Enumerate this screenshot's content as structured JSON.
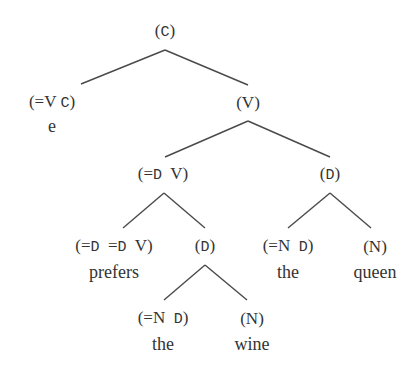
{
  "diagram": {
    "type": "syntax-tree",
    "colors": {
      "text": "#333333",
      "edge": "#4a4a4a",
      "background": "#ffffff"
    },
    "nodes": [
      {
        "id": "root",
        "label": "(C)",
        "segments": [
          {
            "text": "(",
            "font": "serif"
          },
          {
            "text": "C",
            "font": "mono"
          },
          {
            "text": ")",
            "font": "serif"
          }
        ],
        "x": 165,
        "y": 32
      },
      {
        "id": "comp-head",
        "label": "(=V C)",
        "segments": [
          {
            "text": "(=V ",
            "font": "serif"
          },
          {
            "text": "C",
            "font": "mono"
          },
          {
            "text": ")",
            "font": "serif"
          }
        ],
        "word": "e",
        "x": 52,
        "y": 103,
        "word_y": 126
      },
      {
        "id": "vp",
        "label": "(V)",
        "segments": [
          {
            "text": "(V)",
            "font": "serif"
          }
        ],
        "x": 248,
        "y": 103
      },
      {
        "id": "vbar",
        "label": "(=D V)",
        "segments": [
          {
            "text": "(=",
            "font": "serif"
          },
          {
            "text": "D",
            "font": "mono"
          },
          {
            "text": "  V)",
            "font": "serif"
          }
        ],
        "x": 163,
        "y": 175
      },
      {
        "id": "dp-subject",
        "label": "(D)",
        "segments": [
          {
            "text": "(",
            "font": "serif"
          },
          {
            "text": "D",
            "font": "mono"
          },
          {
            "text": ")",
            "font": "serif"
          }
        ],
        "x": 330,
        "y": 175
      },
      {
        "id": "verb",
        "label": "(=D =D V)",
        "segments": [
          {
            "text": "(=",
            "font": "serif"
          },
          {
            "text": "D",
            "font": "mono"
          },
          {
            "text": "  =",
            "font": "serif"
          },
          {
            "text": "D",
            "font": "mono"
          },
          {
            "text": "  V)",
            "font": "serif"
          }
        ],
        "word": "prefers",
        "x": 114,
        "y": 247,
        "word_y": 272
      },
      {
        "id": "dp-object",
        "label": "(D)",
        "segments": [
          {
            "text": "(",
            "font": "serif"
          },
          {
            "text": "D",
            "font": "mono"
          },
          {
            "text": ")",
            "font": "serif"
          }
        ],
        "x": 205,
        "y": 247
      },
      {
        "id": "det-subject",
        "label": "(=N D)",
        "segments": [
          {
            "text": "(=N  ",
            "font": "serif"
          },
          {
            "text": "D",
            "font": "mono"
          },
          {
            "text": ")",
            "font": "serif"
          }
        ],
        "word": "the",
        "x": 288,
        "y": 247,
        "word_y": 272
      },
      {
        "id": "noun-subject",
        "label": "(N)",
        "segments": [
          {
            "text": "(N)",
            "font": "serif"
          }
        ],
        "word": "queen",
        "x": 375,
        "y": 247,
        "word_y": 272
      },
      {
        "id": "det-object",
        "label": "(=N D)",
        "segments": [
          {
            "text": "(=N  ",
            "font": "serif"
          },
          {
            "text": "D",
            "font": "mono"
          },
          {
            "text": ")",
            "font": "serif"
          }
        ],
        "word": "the",
        "x": 163,
        "y": 319,
        "word_y": 344
      },
      {
        "id": "noun-object",
        "label": "(N)",
        "segments": [
          {
            "text": "(N)",
            "font": "serif"
          }
        ],
        "word": "wine",
        "x": 252,
        "y": 319,
        "word_y": 344
      }
    ],
    "edges": [
      {
        "from": "root",
        "to": "comp-head",
        "x1": 165,
        "y1": 50,
        "x2": 81,
        "y2": 84
      },
      {
        "from": "root",
        "to": "vp",
        "x1": 165,
        "y1": 50,
        "x2": 248,
        "y2": 85
      },
      {
        "from": "vp",
        "to": "vbar",
        "x1": 248,
        "y1": 121,
        "x2": 165,
        "y2": 157
      },
      {
        "from": "vp",
        "to": "dp-subject",
        "x1": 248,
        "y1": 121,
        "x2": 330,
        "y2": 157
      },
      {
        "from": "vbar",
        "to": "verb",
        "x1": 164,
        "y1": 193,
        "x2": 123,
        "y2": 228
      },
      {
        "from": "vbar",
        "to": "dp-object",
        "x1": 164,
        "y1": 193,
        "x2": 205,
        "y2": 228
      },
      {
        "from": "dp-subject",
        "to": "det-subject",
        "x1": 330,
        "y1": 193,
        "x2": 288,
        "y2": 228
      },
      {
        "from": "dp-subject",
        "to": "noun-subject",
        "x1": 330,
        "y1": 193,
        "x2": 371,
        "y2": 228
      },
      {
        "from": "dp-object",
        "to": "det-object",
        "x1": 205,
        "y1": 265,
        "x2": 164,
        "y2": 300
      },
      {
        "from": "dp-object",
        "to": "noun-object",
        "x1": 205,
        "y1": 265,
        "x2": 247,
        "y2": 300
      }
    ]
  }
}
